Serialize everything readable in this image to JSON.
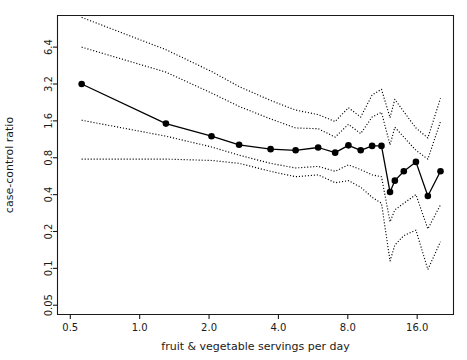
{
  "chart_data": {
    "type": "line",
    "title": "",
    "xlabel": "fruit & vegetable servings per day",
    "ylabel": "case-control ratio",
    "xscale": "log2",
    "yscale": "log2",
    "xlim": [
      0.44,
      23.0
    ],
    "ylim": [
      0.042,
      11.6
    ],
    "xticks": [
      0.5,
      1.0,
      2.0,
      4.0,
      8.0,
      16.0
    ],
    "xticklabels": [
      "0.5",
      "1.0",
      "2.0",
      "4.0",
      "8.0",
      "16.0"
    ],
    "yticks": [
      0.05,
      0.1,
      0.2,
      0.4,
      0.8,
      1.6,
      3.2,
      6.4
    ],
    "yticklabels": [
      "0.05",
      "0.1",
      "0.2",
      "0.4",
      "0.8",
      "1.6",
      "3.2",
      "6.4"
    ],
    "grid": false,
    "legend": false,
    "series": [
      {
        "name": "case-control ratio estimate",
        "style": "solid-with-markers",
        "x": [
          0.56,
          1.3,
          2.05,
          2.7,
          3.7,
          4.75,
          5.95,
          7.05,
          8.05,
          9.1,
          10.2,
          11.2,
          12.2,
          12.8,
          14.0,
          15.8,
          17.8,
          20.2
        ],
        "y": [
          3.2,
          1.52,
          1.2,
          1.02,
          0.94,
          0.92,
          0.97,
          0.88,
          1.01,
          0.92,
          1.0,
          1.0,
          0.42,
          0.52,
          0.62,
          0.74,
          0.39,
          0.62
        ]
      },
      {
        "name": "upper outer confidence band",
        "style": "dotted",
        "x": [
          0.56,
          1.3,
          2.05,
          2.7,
          3.7,
          4.75,
          5.95,
          7.05,
          8.05,
          9.1,
          10.2,
          11.2,
          12.2,
          12.8,
          14.0,
          15.8,
          17.8,
          20.2
        ],
        "y": [
          11.2,
          6.1,
          4.05,
          3.05,
          2.35,
          1.96,
          1.8,
          1.58,
          2.05,
          1.72,
          2.6,
          2.9,
          1.7,
          2.4,
          1.9,
          1.4,
          1.16,
          2.45
        ]
      },
      {
        "name": "upper inner confidence band",
        "style": "dotted",
        "x": [
          0.56,
          1.3,
          2.05,
          2.7,
          3.7,
          4.75,
          5.95,
          7.05,
          8.05,
          9.1,
          10.2,
          11.2,
          12.2,
          12.8,
          14.0,
          15.8,
          17.8,
          20.2
        ],
        "y": [
          6.4,
          4.0,
          2.7,
          2.1,
          1.66,
          1.4,
          1.38,
          1.18,
          1.5,
          1.26,
          1.72,
          1.88,
          1.02,
          1.42,
          1.18,
          0.92,
          0.78,
          1.58
        ]
      },
      {
        "name": "lower inner confidence band",
        "style": "dotted",
        "x": [
          0.56,
          1.3,
          2.05,
          2.7,
          3.7,
          4.75,
          5.95,
          7.05,
          8.05,
          9.1,
          10.2,
          11.2,
          12.2,
          12.8,
          14.0,
          15.8,
          17.8,
          20.2
        ],
        "y": [
          1.62,
          1.2,
          0.98,
          0.84,
          0.72,
          0.66,
          0.68,
          0.62,
          0.7,
          0.64,
          0.58,
          0.56,
          0.24,
          0.3,
          0.34,
          0.4,
          0.21,
          0.33
        ]
      },
      {
        "name": "lower outer confidence band",
        "style": "dotted",
        "x": [
          0.56,
          1.3,
          2.05,
          2.7,
          3.7,
          4.75,
          5.95,
          7.05,
          8.05,
          9.1,
          10.2,
          11.2,
          12.2,
          12.8,
          14.0,
          15.8,
          17.8,
          20.2
        ],
        "y": [
          0.78,
          0.78,
          0.76,
          0.72,
          0.62,
          0.56,
          0.58,
          0.5,
          0.52,
          0.46,
          0.38,
          0.34,
          0.115,
          0.155,
          0.185,
          0.205,
          0.098,
          0.165
        ]
      }
    ]
  }
}
